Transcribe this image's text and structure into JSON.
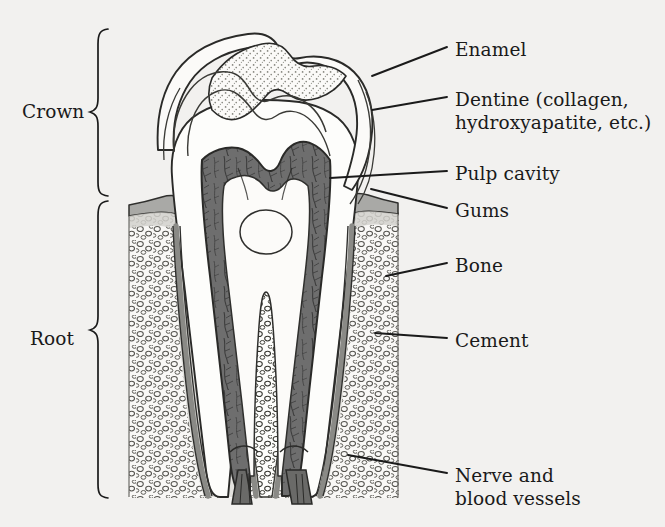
{
  "figure": {
    "background_color": "#f2f1ef",
    "ink_color": "#1a1a1a"
  },
  "region_labels": [
    {
      "name": "crown",
      "text": "Crown",
      "x": 22,
      "y": 100,
      "brace_top": 28,
      "brace_bottom": 196
    },
    {
      "name": "root",
      "text": "Root",
      "x": 30,
      "y": 327,
      "brace_top": 200,
      "brace_bottom": 498
    }
  ],
  "callouts": [
    {
      "name": "enamel",
      "text": "Enamel",
      "text2": "",
      "x": 455,
      "y": 38,
      "leader": [
        [
          447,
          47
        ],
        [
          372,
          76
        ]
      ]
    },
    {
      "name": "dentine",
      "text": "Dentine (collagen,",
      "text2": "hydroxyapatite, etc.)",
      "x": 455,
      "y": 88,
      "leader": [
        [
          447,
          97
        ],
        [
          372,
          110
        ]
      ]
    },
    {
      "name": "pulp-cavity",
      "text": "Pulp cavity",
      "text2": "",
      "x": 455,
      "y": 162,
      "leader": [
        [
          447,
          171
        ],
        [
          330,
          178
        ]
      ]
    },
    {
      "name": "gums",
      "text": "Gums",
      "text2": "",
      "x": 455,
      "y": 199,
      "leader": [
        [
          447,
          208
        ],
        [
          371,
          189
        ]
      ]
    },
    {
      "name": "bone",
      "text": "Bone",
      "text2": "",
      "x": 455,
      "y": 254,
      "leader": [
        [
          447,
          263
        ],
        [
          386,
          276
        ]
      ]
    },
    {
      "name": "cement",
      "text": "Cement",
      "text2": "",
      "x": 455,
      "y": 329,
      "leader": [
        [
          447,
          338
        ],
        [
          375,
          333
        ]
      ]
    },
    {
      "name": "nerve",
      "text": "Nerve and",
      "text2": "blood vessels",
      "x": 455,
      "y": 464,
      "leader": [
        [
          447,
          473
        ],
        [
          348,
          455
        ]
      ]
    }
  ],
  "tissue_colors": {
    "enamel": "#fbfaf8",
    "enamel_stipple": "#7a7a74",
    "dentine": "#fdfdfb",
    "pulp": "#6e6e6e",
    "pulp_inner": "#8b8b8b",
    "gum": "#a9a9a6",
    "bone_fill": "#fdfdfb",
    "bone_cell": "#3a3a38",
    "periodontal": "#d6d5d1",
    "cement": "#8a8a86",
    "nerve": "#6a6a68",
    "outline": "#2a2a28"
  },
  "structures": [
    {
      "name": "enamel-layer",
      "label": "Enamel"
    },
    {
      "name": "dentine-layer",
      "label": "Dentine"
    },
    {
      "name": "pulp-cavity",
      "label": "Pulp cavity"
    },
    {
      "name": "gum-tissue",
      "label": "Gums"
    },
    {
      "name": "alveolar-bone",
      "label": "Bone"
    },
    {
      "name": "cement-layer",
      "label": "Cement"
    },
    {
      "name": "nerve-bundle",
      "label": "Nerve and blood vessels"
    }
  ]
}
